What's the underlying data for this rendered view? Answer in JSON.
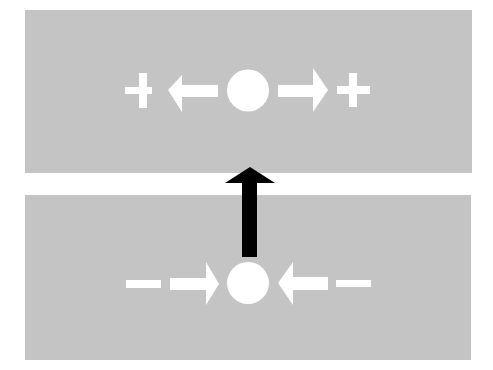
{
  "diagram": {
    "title": "",
    "colors": {
      "background": "#ffffff",
      "panel": "#c4c4c4",
      "symbol": "#ffffff",
      "transition_arrow": "#000000"
    },
    "panels": [
      {
        "id": "upper-state",
        "description": "Charge with outward arrows toward positive signs",
        "sign": "+",
        "arrow_direction": "outward",
        "sequence": [
          "plus-sign",
          "left-arrow",
          "circle",
          "right-arrow",
          "plus-sign"
        ]
      },
      {
        "id": "lower-state",
        "description": "Charge with inward arrows from negative signs",
        "sign": "-",
        "arrow_direction": "inward",
        "sequence": [
          "minus-sign",
          "right-arrow",
          "circle",
          "left-arrow",
          "minus-sign"
        ]
      }
    ],
    "transition": {
      "from": "lower-state",
      "to": "upper-state",
      "direction": "up"
    }
  }
}
